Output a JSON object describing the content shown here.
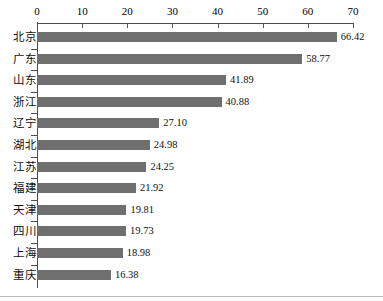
{
  "chart_data": {
    "type": "bar",
    "orientation": "horizontal",
    "title": "",
    "subtitle": "",
    "xlabel": "",
    "ylabel": "",
    "xlim": [
      0,
      70
    ],
    "x_ticks": [
      0,
      10,
      20,
      30,
      40,
      50,
      60,
      70
    ],
    "x_tick_labels": [
      "0",
      "10",
      "20",
      "30",
      "40",
      "50",
      "60",
      "70"
    ],
    "grid": false,
    "legend": null,
    "axis_position": "top",
    "bar_color": "#6f6f6f",
    "categories": [
      "北京",
      "广东",
      "山东",
      "浙江",
      "辽宁",
      "湖北",
      "江苏",
      "福建",
      "天津",
      "四川",
      "上海",
      "重庆"
    ],
    "values": [
      66.42,
      58.77,
      41.89,
      40.88,
      27.1,
      24.98,
      24.25,
      21.92,
      19.81,
      19.73,
      18.98,
      16.38
    ],
    "value_labels": [
      "66.42",
      "58.77",
      "41.89",
      "40.88",
      "27.10",
      "24.98",
      "24.25",
      "21.92",
      "19.81",
      "19.73",
      "18.98",
      "16.38"
    ],
    "bars": [
      {
        "category": "北京",
        "value": 66.42,
        "label": "66.42"
      },
      {
        "category": "广东",
        "value": 58.77,
        "label": "58.77"
      },
      {
        "category": "山东",
        "value": 41.89,
        "label": "41.89"
      },
      {
        "category": "浙江",
        "value": 40.88,
        "label": "40.88"
      },
      {
        "category": "辽宁",
        "value": 27.1,
        "label": "27.10"
      },
      {
        "category": "湖北",
        "value": 24.98,
        "label": "24.98"
      },
      {
        "category": "江苏",
        "value": 24.25,
        "label": "24.25"
      },
      {
        "category": "福建",
        "value": 21.92,
        "label": "21.92"
      },
      {
        "category": "天津",
        "value": 19.81,
        "label": "19.81"
      },
      {
        "category": "四川",
        "value": 19.73,
        "label": "19.73"
      },
      {
        "category": "上海",
        "value": 18.98,
        "label": "18.98"
      },
      {
        "category": "重庆",
        "value": 16.38,
        "label": "16.38"
      }
    ]
  }
}
